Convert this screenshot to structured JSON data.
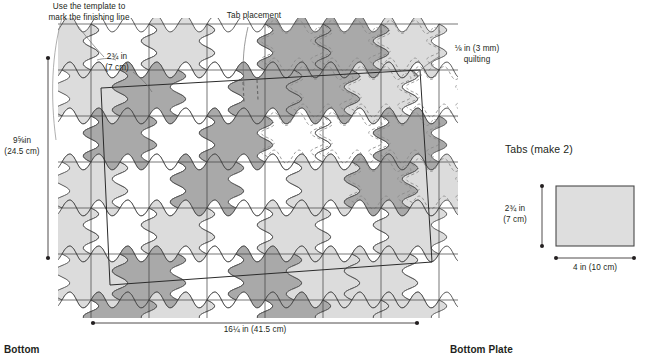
{
  "figure": {
    "left_panel_caption": "Bottom",
    "right_panel_caption": "Bottom Plate"
  },
  "annotations": {
    "template_note": "Use the template to\nmark the finishing line",
    "tab_placement": "Tab placement",
    "quilting": "⅛ in (3 mm)\nquilting",
    "patch_size": "2¾ in\n(7 cm)"
  },
  "dimensions": {
    "bottom_height": "9⅝in\n(24.5 cm)",
    "bottom_width": "16¼ in (41.5 cm)",
    "tab_height": "2¾ in\n(7 cm)",
    "tab_width": "4 in (10 cm)"
  },
  "tabs_panel": {
    "title": "Tabs (make 2)"
  },
  "colors": {
    "ink": "#231f20",
    "line": "#4a4a4a",
    "patch_white": "#ffffff",
    "patch_light": "#dcdcdc",
    "patch_dark": "#a9a9a9",
    "tab_fill": "#dedede",
    "quilt_dash": "#8a8a8a"
  },
  "pattern": {
    "note": "wave / apple-core tessellation",
    "cell_w": 58,
    "cell_h": 46,
    "cols": 7,
    "rows": 7,
    "origin_x": 62,
    "origin_y": 24,
    "shades": [
      [
        "light",
        "white",
        "light",
        "white",
        "dark",
        "dark",
        "light"
      ],
      [
        "light",
        "dark",
        "white",
        "dark",
        "dark",
        "light",
        "white"
      ],
      [
        "white",
        "dark",
        "white",
        "dark",
        "white",
        "white",
        "dark"
      ],
      [
        "light",
        "white",
        "dark",
        "white",
        "light",
        "dark",
        "light"
      ],
      [
        "light",
        "white",
        "light",
        "white",
        "light",
        "white",
        "light"
      ],
      [
        "light",
        "dark",
        "white",
        "dark",
        "light",
        "light",
        "white"
      ],
      [
        "white",
        "dark",
        "light",
        "white",
        "dark",
        "light",
        "light"
      ]
    ],
    "quilted_cells": [
      [
        0,
        4
      ],
      [
        0,
        5
      ],
      [
        0,
        6
      ],
      [
        1,
        4
      ],
      [
        1,
        5
      ],
      [
        1,
        6
      ],
      [
        2,
        4
      ],
      [
        2,
        5
      ],
      [
        2,
        6
      ],
      [
        3,
        5
      ],
      [
        3,
        6
      ]
    ]
  },
  "tab_rect": {
    "x": 556,
    "y": 186,
    "w": 78,
    "h": 60
  }
}
